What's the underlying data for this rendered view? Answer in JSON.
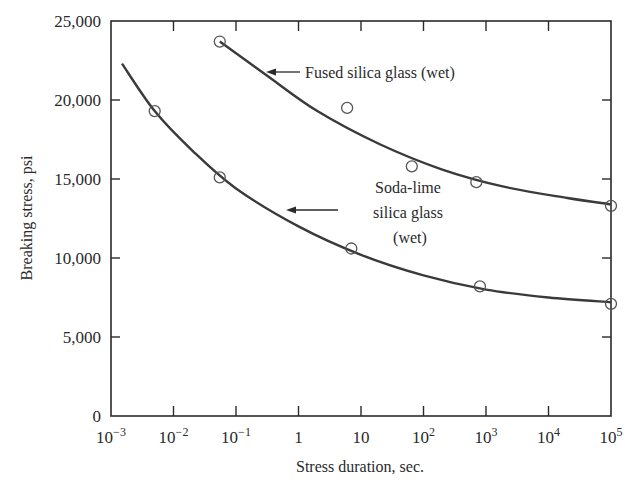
{
  "chart_data": {
    "type": "line",
    "title": "",
    "xlabel": "Stress duration, sec.",
    "ylabel": "Breaking stress, psi",
    "x_scale": "log",
    "xlim_log10": [
      -3,
      5
    ],
    "ylim": [
      0,
      25000
    ],
    "grid": false,
    "legend": "none (inline annotations with arrows)",
    "x_ticks": [
      {
        "exp": -3,
        "base": "10",
        "sup": "−3"
      },
      {
        "exp": -2,
        "base": "10",
        "sup": "−2"
      },
      {
        "exp": -1,
        "base": "10",
        "sup": "−1"
      },
      {
        "exp": 0,
        "base": "1",
        "sup": ""
      },
      {
        "exp": 1,
        "base": "10",
        "sup": ""
      },
      {
        "exp": 2,
        "base": "10",
        "sup": "2"
      },
      {
        "exp": 3,
        "base": "10",
        "sup": "3"
      },
      {
        "exp": 4,
        "base": "10",
        "sup": "4"
      },
      {
        "exp": 5,
        "base": "10",
        "sup": "5"
      }
    ],
    "y_ticks": [
      {
        "value": 0,
        "label": "0"
      },
      {
        "value": 5000,
        "label": "5,000"
      },
      {
        "value": 10000,
        "label": "10,000"
      },
      {
        "value": 15000,
        "label": "15,000"
      },
      {
        "value": 20000,
        "label": "20,000"
      },
      {
        "value": 25000,
        "label": "25,000"
      }
    ],
    "series": [
      {
        "name": "Fused silica glass (wet)",
        "marker": "open-circle",
        "points": [
          {
            "x": 0.055,
            "y": 23700
          },
          {
            "x": 6,
            "y": 19500
          },
          {
            "x": 65,
            "y": 15800
          },
          {
            "x": 700,
            "y": 14800
          },
          {
            "x": 100000,
            "y": 13300
          }
        ],
        "curve": [
          {
            "x": 0.055,
            "y": 23700
          },
          {
            "x": 0.3,
            "y": 21600
          },
          {
            "x": 2,
            "y": 19300
          },
          {
            "x": 20,
            "y": 17200
          },
          {
            "x": 200,
            "y": 15600
          },
          {
            "x": 2000,
            "y": 14500
          },
          {
            "x": 20000,
            "y": 13800
          },
          {
            "x": 100000,
            "y": 13400
          }
        ]
      },
      {
        "name": "Soda-lime silica glass (wet)",
        "marker": "open-circle",
        "points": [
          {
            "x": 0.005,
            "y": 19300
          },
          {
            "x": 0.055,
            "y": 15100
          },
          {
            "x": 7,
            "y": 10600
          },
          {
            "x": 800,
            "y": 8200
          },
          {
            "x": 100000,
            "y": 7100
          }
        ],
        "curve": [
          {
            "x": 0.0015,
            "y": 22300
          },
          {
            "x": 0.005,
            "y": 19300
          },
          {
            "x": 0.02,
            "y": 16800
          },
          {
            "x": 0.1,
            "y": 14400
          },
          {
            "x": 1,
            "y": 12000
          },
          {
            "x": 10,
            "y": 10200
          },
          {
            "x": 100,
            "y": 8900
          },
          {
            "x": 1000,
            "y": 8000
          },
          {
            "x": 10000,
            "y": 7500
          },
          {
            "x": 100000,
            "y": 7200
          }
        ]
      }
    ],
    "annotations": [
      {
        "text_lines": [
          "Fused silica glass (wet)"
        ],
        "arrow": "left",
        "points_to": "Fused silica glass (wet)"
      },
      {
        "text_lines": [
          "Soda-lime",
          "silica glass",
          "(wet)"
        ],
        "arrow": "left",
        "points_to": "Soda-lime silica glass (wet)"
      }
    ]
  },
  "labels": {
    "xlabel": "Stress duration, sec.",
    "ylabel": "Breaking stress, psi",
    "fused_annotation": "Fused silica glass (wet)",
    "soda_line1": "Soda-lime",
    "soda_line2": "silica glass",
    "soda_line3": "(wet)"
  },
  "colors": {
    "line": "#3a3a3a",
    "axis": "#2a2a2a",
    "marker": "#555555",
    "background": "#ffffff"
  }
}
